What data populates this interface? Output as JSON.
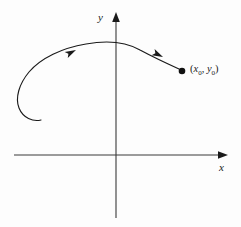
{
  "figure": {
    "background_color": "#fdfdfd",
    "stroke_color": "#1a1a1a",
    "axis_color": "#3a3a3a",
    "width": 241,
    "height": 227
  },
  "axes": {
    "x_label": "x",
    "y_label": "y",
    "origin": {
      "x": 116,
      "y": 155
    },
    "x_start": {
      "x": 14,
      "y": 155
    },
    "x_arrow_tip": {
      "x": 228,
      "y": 155
    },
    "y_arrow_tip": {
      "x": 116,
      "y": 12
    },
    "y_end": {
      "x": 116,
      "y": 218
    },
    "arrowheads": "both-positive-directions",
    "grid": false,
    "tick_labels": []
  },
  "point": {
    "label_parts": {
      "open_paren": "(",
      "x_symbol": "x",
      "x_subscript": "0",
      "comma": ",",
      "y_symbol": "y",
      "y_subscript": "0",
      "close_paren": ")"
    },
    "label_text": "(x0, y0)",
    "marker": "filled-circle",
    "marker_radius": 3.2,
    "position": {
      "x": 182,
      "y": 71
    }
  },
  "curve": {
    "description": "Counterclockwise inward spiral: begins as a small hook at lower left, unwinds leftward and upward, arcs over the y-axis, then descends rightward to the marked point.",
    "direction": "toward-the-point",
    "stroke_width": 1.1,
    "hook_end": {
      "x": 41,
      "y": 120
    },
    "leftmost": {
      "x": 18,
      "y": 96
    },
    "peak": {
      "x": 131,
      "y": 47
    },
    "end": {
      "x": 179,
      "y": 69
    },
    "direction_arrows": [
      {
        "at": {
          "x": 73,
          "y": 52
        },
        "angle_deg": -29
      },
      {
        "at": {
          "x": 158,
          "y": 55
        },
        "angle_deg": 26
      }
    ]
  }
}
